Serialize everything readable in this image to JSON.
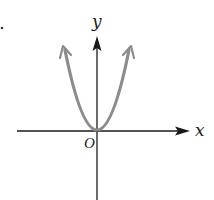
{
  "diagram": {
    "type": "graph-sketch",
    "axes": {
      "x_label": "x",
      "y_label": "y",
      "origin_label": "O"
    },
    "curve": {
      "shape": "parabola",
      "equation_form": "y = ax^2, a > 0",
      "vertex": "origin",
      "opens": "up",
      "color": "#8c8c8c",
      "end_arrows": true
    },
    "colors": {
      "axis": "#1a1a1a",
      "curve": "#8c8c8c"
    }
  }
}
